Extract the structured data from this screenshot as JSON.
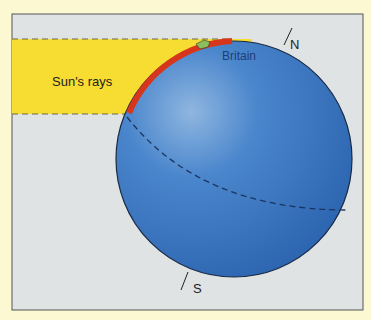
{
  "labels": {
    "sun_rays": "Sun's rays",
    "britain": "Britain",
    "north": "N",
    "south": "S"
  },
  "colors": {
    "background": "#fbf8d2",
    "panel": "#dfe3e4",
    "sun_rays": "#f7dc32",
    "globe": "#3a79c4",
    "lit_arc": "#d8361c",
    "britain_label": "#1e3e78"
  }
}
